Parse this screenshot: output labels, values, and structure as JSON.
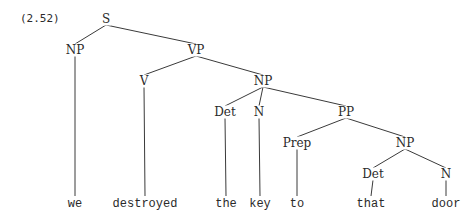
{
  "example_number": "(2.52)",
  "tree": {
    "nodes": [
      {
        "id": "S",
        "label": "S",
        "x": 106,
        "y": 19,
        "type": "category"
      },
      {
        "id": "NP1",
        "label": "NP",
        "x": 75,
        "y": 50,
        "type": "category"
      },
      {
        "id": "VP",
        "label": "VP",
        "x": 196,
        "y": 50,
        "type": "category"
      },
      {
        "id": "V",
        "label": "V",
        "x": 144,
        "y": 81,
        "type": "category"
      },
      {
        "id": "NP2",
        "label": "NP",
        "x": 263,
        "y": 81,
        "type": "category"
      },
      {
        "id": "Det1",
        "label": "Det",
        "x": 225,
        "y": 112,
        "type": "category"
      },
      {
        "id": "N1",
        "label": "N",
        "x": 259,
        "y": 112,
        "type": "category"
      },
      {
        "id": "PP",
        "label": "PP",
        "x": 346,
        "y": 112,
        "type": "category"
      },
      {
        "id": "Prep",
        "label": "Prep",
        "x": 297,
        "y": 143,
        "type": "category"
      },
      {
        "id": "NP3",
        "label": "NP",
        "x": 405,
        "y": 143,
        "type": "category"
      },
      {
        "id": "Det2",
        "label": "Det",
        "x": 373,
        "y": 174,
        "type": "category"
      },
      {
        "id": "N2",
        "label": "N",
        "x": 446,
        "y": 174,
        "type": "category"
      },
      {
        "id": "w_we",
        "label": "we",
        "x": 75,
        "y": 204,
        "type": "word"
      },
      {
        "id": "w_destroyed",
        "label": "destroyed",
        "x": 145,
        "y": 204,
        "type": "word"
      },
      {
        "id": "w_the",
        "label": "the",
        "x": 226,
        "y": 204,
        "type": "word"
      },
      {
        "id": "w_key",
        "label": "key",
        "x": 260,
        "y": 204,
        "type": "word"
      },
      {
        "id": "w_to",
        "label": "to",
        "x": 297,
        "y": 204,
        "type": "word"
      },
      {
        "id": "w_that",
        "label": "that",
        "x": 371,
        "y": 204,
        "type": "word"
      },
      {
        "id": "w_door",
        "label": "door",
        "x": 446,
        "y": 204,
        "type": "word"
      }
    ],
    "edges": [
      [
        "S",
        "NP1"
      ],
      [
        "S",
        "VP"
      ],
      [
        "NP1",
        "w_we"
      ],
      [
        "VP",
        "V"
      ],
      [
        "VP",
        "NP2"
      ],
      [
        "V",
        "w_destroyed"
      ],
      [
        "NP2",
        "Det1"
      ],
      [
        "NP2",
        "N1"
      ],
      [
        "NP2",
        "PP"
      ],
      [
        "Det1",
        "w_the"
      ],
      [
        "N1",
        "w_key"
      ],
      [
        "PP",
        "Prep"
      ],
      [
        "PP",
        "NP3"
      ],
      [
        "Prep",
        "w_to"
      ],
      [
        "NP3",
        "Det2"
      ],
      [
        "NP3",
        "N2"
      ],
      [
        "Det2",
        "w_that"
      ],
      [
        "N2",
        "w_door"
      ]
    ]
  }
}
